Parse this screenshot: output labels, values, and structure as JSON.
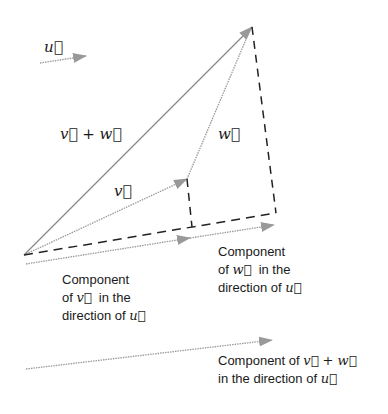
{
  "labels": {
    "u": "u⃗",
    "v": "v⃗",
    "w": "w⃗",
    "v_plus_w": "v⃗ + w⃗",
    "comp_v": {
      "line1": "Component",
      "line2_pre": "of ",
      "line2_vec": "v⃗",
      "line2_post": "  in the",
      "line3_pre": "direction of ",
      "line3_vec": "u⃗"
    },
    "comp_w": {
      "line1": "Component",
      "line2_pre": "of ",
      "line2_vec": "w⃗",
      "line2_post": "  in the",
      "line3_pre": "direction of ",
      "line3_vec": "u⃗"
    },
    "comp_vw": {
      "line1_pre": "Component of ",
      "line1_vec": "v⃗ + w⃗",
      "line2_pre": "in the direction of ",
      "line2_vec": "u⃗"
    }
  },
  "colors": {
    "line": "#888888",
    "arrowhead": "#999999",
    "dash": "#222222",
    "text": "#1a1a1a"
  }
}
